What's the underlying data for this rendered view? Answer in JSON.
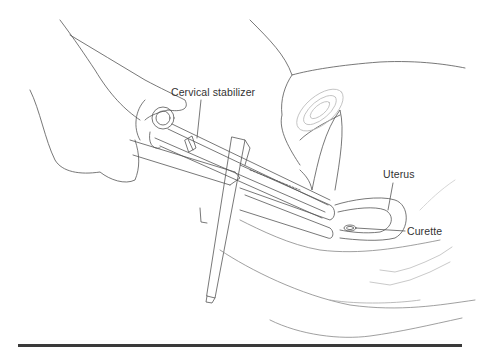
{
  "figure": {
    "kind": "medical line illustration",
    "labels": {
      "cervical_stabilizer": "Cervical stabilizer",
      "uterus": "Uterus",
      "curette": "Curette"
    },
    "colors": {
      "line": "#555555",
      "text": "#333333",
      "rule": "#3a3a3a",
      "stipple": "#bbbbbb"
    }
  }
}
